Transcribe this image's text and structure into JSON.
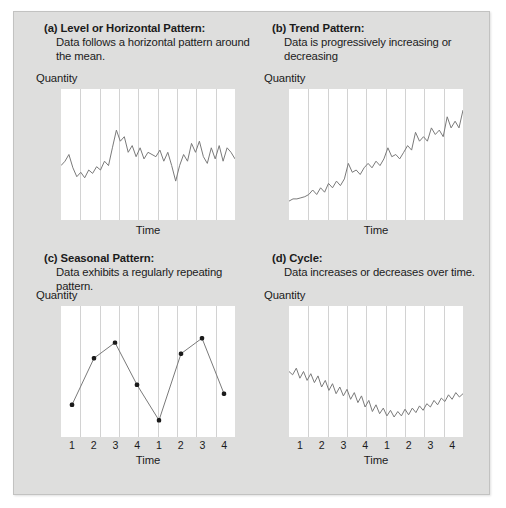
{
  "figure": {
    "background_color": "#dededd",
    "plot_background_color": "#ffffff",
    "line_color": "#7a7a7a",
    "gridline_color": "#d2d2d2",
    "marker_color": "#1b1b1b"
  },
  "panels": [
    {
      "key": "a",
      "title": "(a) Level or Horizontal Pattern:",
      "description": "Data follows a horizontal pattern around the mean.",
      "ylabel": "Quantity",
      "xlabel": "Time",
      "ticks": []
    },
    {
      "key": "b",
      "title": "(b) Trend Pattern:",
      "description": "Data is progressively increasing or decreasing",
      "ylabel": "Quantity",
      "xlabel": "Time",
      "ticks": []
    },
    {
      "key": "c",
      "title": "(c) Seasonal Pattern:",
      "description": "Data exhibits a regularly repeating pattern.",
      "ylabel": "Quantity",
      "xlabel": "Time",
      "ticks": [
        "1",
        "2",
        "3",
        "4",
        "1",
        "2",
        "3",
        "4"
      ]
    },
    {
      "key": "d",
      "title": "(d) Cycle:",
      "description": "Data increases or decreases over time.",
      "ylabel": "Quantity",
      "xlabel": "Time",
      "ticks": [
        "1",
        "2",
        "3",
        "4",
        "1",
        "2",
        "3",
        "4"
      ]
    }
  ],
  "chart_data": [
    {
      "type": "line",
      "panel": "a",
      "title": "(a) Level or Horizontal Pattern",
      "xlabel": "Time",
      "ylabel": "Quantity",
      "ylim": [
        0,
        100
      ],
      "xlim": [
        0,
        44
      ],
      "grid": "vertical",
      "gridlines": 8,
      "markers": false,
      "x": [
        0,
        1,
        2,
        3,
        4,
        5,
        6,
        7,
        8,
        9,
        10,
        11,
        12,
        13,
        14,
        15,
        16,
        17,
        18,
        19,
        20,
        21,
        22,
        23,
        24,
        25,
        26,
        27,
        28,
        29,
        30,
        31,
        32,
        33,
        34,
        35,
        36,
        37,
        38,
        39,
        40,
        41,
        42,
        43,
        44
      ],
      "values": [
        40,
        44,
        50,
        38,
        30,
        34,
        29,
        36,
        33,
        39,
        36,
        44,
        40,
        56,
        72,
        62,
        66,
        52,
        58,
        48,
        56,
        46,
        52,
        50,
        48,
        54,
        44,
        52,
        40,
        26,
        40,
        50,
        44,
        60,
        52,
        62,
        48,
        42,
        56,
        46,
        58,
        44,
        56,
        52,
        46
      ]
    },
    {
      "type": "line",
      "panel": "b",
      "title": "(b) Trend Pattern",
      "xlabel": "Time",
      "ylabel": "Quantity",
      "ylim": [
        0,
        100
      ],
      "xlim": [
        0,
        44
      ],
      "grid": "vertical",
      "gridlines": 8,
      "markers": false,
      "x": [
        0,
        1,
        2,
        3,
        4,
        5,
        6,
        7,
        8,
        9,
        10,
        11,
        12,
        13,
        14,
        15,
        16,
        17,
        18,
        19,
        20,
        21,
        22,
        23,
        24,
        25,
        26,
        27,
        28,
        29,
        30,
        31,
        32,
        33,
        34,
        35,
        36,
        37,
        38,
        39,
        40,
        41,
        42,
        43,
        44
      ],
      "values": [
        8,
        10,
        10,
        11,
        12,
        14,
        18,
        14,
        20,
        16,
        24,
        20,
        26,
        22,
        28,
        42,
        34,
        36,
        32,
        38,
        42,
        38,
        44,
        40,
        46,
        56,
        48,
        50,
        46,
        52,
        58,
        54,
        70,
        62,
        66,
        62,
        74,
        68,
        72,
        66,
        84,
        74,
        80,
        74,
        90
      ]
    },
    {
      "type": "line",
      "panel": "c",
      "title": "(c) Seasonal Pattern",
      "xlabel": "Time",
      "ylabel": "Quantity",
      "ylim": [
        0,
        100
      ],
      "xlim": [
        1,
        8
      ],
      "grid": "vertical",
      "gridlines": 8,
      "markers": true,
      "categories": [
        "1",
        "2",
        "3",
        "4",
        "1",
        "2",
        "3",
        "4"
      ],
      "values": [
        20,
        62,
        76,
        38,
        6,
        66,
        80,
        30
      ]
    },
    {
      "type": "line",
      "panel": "d",
      "title": "(d) Cycle",
      "xlabel": "Time",
      "ylabel": "Quantity",
      "ylim": [
        0,
        100
      ],
      "xlim": [
        0,
        48
      ],
      "grid": "vertical",
      "gridlines": 8,
      "markers": false,
      "categories": [
        "1",
        "2",
        "3",
        "4",
        "1",
        "2",
        "3",
        "4"
      ],
      "x": [
        0,
        1,
        2,
        3,
        4,
        5,
        6,
        7,
        8,
        9,
        10,
        11,
        12,
        13,
        14,
        15,
        16,
        17,
        18,
        19,
        20,
        21,
        22,
        23,
        24,
        25,
        26,
        27,
        28,
        29,
        30,
        31,
        32,
        33,
        34,
        35,
        36,
        37,
        38,
        39,
        40,
        41,
        42,
        43,
        44,
        45,
        46,
        47,
        48
      ],
      "values": [
        50,
        47,
        53,
        44,
        50,
        42,
        48,
        40,
        46,
        36,
        42,
        33,
        39,
        30,
        36,
        28,
        34,
        25,
        31,
        22,
        28,
        18,
        24,
        14,
        20,
        12,
        17,
        10,
        15,
        9,
        14,
        10,
        16,
        11,
        17,
        13,
        19,
        15,
        21,
        18,
        24,
        20,
        26,
        23,
        29,
        25,
        31,
        27,
        30
      ]
    }
  ]
}
